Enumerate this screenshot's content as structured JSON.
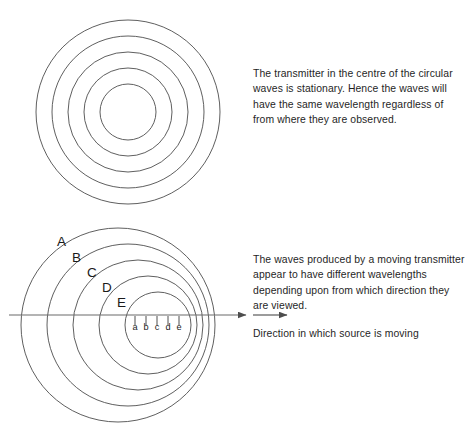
{
  "figure": {
    "title_hidden": "Doppler effect of circular waves",
    "background_color": "#ffffff",
    "stroke_color": "#4d4d4d",
    "text_color": "#1f1f1f"
  },
  "stationary_diagram": {
    "label": "Stationary transmitter wavefronts",
    "center": {
      "x": 128,
      "y": 112
    },
    "radii": [
      28,
      44,
      60,
      76,
      92
    ],
    "wave_count": 5
  },
  "moving_diagram": {
    "label": "Moving transmitter wavefronts",
    "wave_count": 5,
    "wavefronts": [
      {
        "name": "A",
        "cx": 118,
        "cy": 325,
        "r": 97
      },
      {
        "name": "B",
        "cx": 128,
        "cy": 325,
        "r": 81
      },
      {
        "name": "C",
        "cx": 138,
        "cy": 325,
        "r": 65
      },
      {
        "name": "D",
        "cx": 148,
        "cy": 325,
        "r": 49
      },
      {
        "name": "E",
        "cx": 158,
        "cy": 325,
        "r": 33
      }
    ],
    "wave_labels": [
      {
        "text": "A",
        "x": 57,
        "y": 246
      },
      {
        "text": "B",
        "x": 72,
        "y": 262
      },
      {
        "text": "C",
        "x": 87,
        "y": 277
      },
      {
        "text": "D",
        "x": 102,
        "y": 292
      },
      {
        "text": "E",
        "x": 117,
        "y": 307
      }
    ],
    "tick_labels": [
      {
        "text": "a",
        "x": 135,
        "tick_x": 135
      },
      {
        "text": "b",
        "x": 146,
        "tick_x": 146
      },
      {
        "text": "c",
        "x": 157,
        "tick_x": 157
      },
      {
        "text": "d",
        "x": 168,
        "tick_x": 168
      },
      {
        "text": "e",
        "x": 179,
        "tick_x": 179
      }
    ],
    "tick_label_baseline_y": 330,
    "axis": {
      "y": 315,
      "x_start": 9,
      "x_end": 246,
      "arrowhead": true
    }
  },
  "captions": {
    "stationary": "The transmitter in the centre of the circular waves is stationary. Hence the waves will have the same wavelength regardless of from where they are observed.",
    "moving": "The waves produced by a moving transmitter appear to have different wavelengths depending upon from which direction they are viewed.",
    "direction": "Direction in which source is moving"
  },
  "direction_arrow": {
    "label": "direction of motion arrow",
    "x_start": 253,
    "x_end": 287,
    "y": 315
  }
}
